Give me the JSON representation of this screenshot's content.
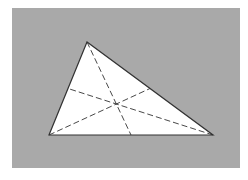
{
  "figure": {
    "background_color": "#ffffff",
    "panel_color": "#a9a9a9",
    "triangle_fill": "#ffffff",
    "stroke_color": "#333333",
    "panel": {
      "x": 12,
      "y": 8,
      "width": 228,
      "height": 160
    },
    "vertices": {
      "A": [
        87,
        42
      ],
      "B": [
        49,
        135
      ],
      "C": [
        213,
        135
      ]
    },
    "medians": [
      {
        "from": "A",
        "to_midpoint_of": "BC",
        "x1": 87,
        "y1": 42,
        "x2": 131,
        "y2": 135
      },
      {
        "from": "B",
        "to_midpoint_of": "AC",
        "x1": 49,
        "y1": 135,
        "x2": 150,
        "y2": 88.5
      },
      {
        "from": "C",
        "to_midpoint_of": "AB",
        "x1": 213,
        "y1": 135,
        "x2": 68,
        "y2": 88.5
      }
    ],
    "centroid": [
      116.3,
      104
    ]
  }
}
